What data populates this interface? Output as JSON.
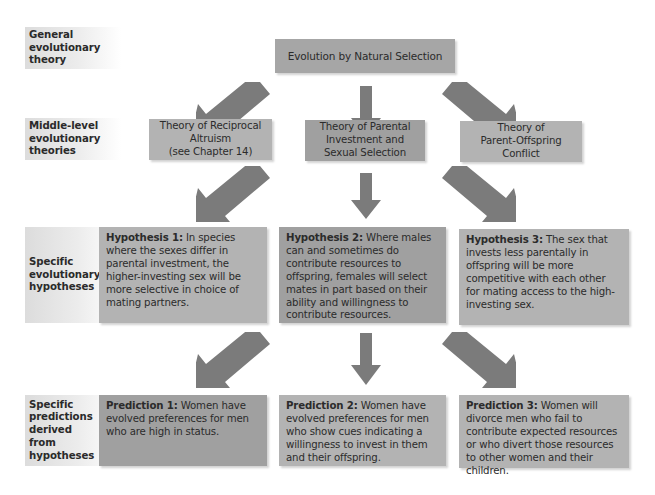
{
  "row_labels": {
    "general": "General evolutionary theory",
    "middle": "Middle-level evolutionary theories",
    "hypotheses": "Specific evolutionary hypotheses",
    "predictions": "Specific predictions derived from hypotheses"
  },
  "top": {
    "title": "Evolution by Natural Selection"
  },
  "middle_theories": [
    {
      "lines": [
        "Theory of Reciprocal",
        "Altruism",
        "(see Chapter 14)"
      ]
    },
    {
      "lines": [
        "Theory of Parental",
        "Investment and",
        "Sexual Selection"
      ]
    },
    {
      "lines": [
        "Theory of",
        "Parent-Offspring",
        "Conflict"
      ]
    }
  ],
  "hypotheses": [
    {
      "title": "Hypothesis 1:",
      "text": " In species where the sexes differ in parental investment, the higher-investing sex will be more selective in choice of mating partners."
    },
    {
      "title": "Hypothesis 2:",
      "text": " Where males can and sometimes do contribute resources to offspring, females will select mates in part based on their ability and willingness to contribute resources."
    },
    {
      "title": "Hypothesis 3:",
      "text": " The sex that invests less parentally in offspring will be more competitive with each other for mating access to the high-investing sex."
    }
  ],
  "predictions": [
    {
      "title": "Prediction 1:",
      "text": " Women have evolved preferences for men who are high in status."
    },
    {
      "title": "Prediction 2:",
      "text": " Women have evolved preferences for men who show cues indicating a willingness to invest in them and their offspring."
    },
    {
      "title": "Prediction 3:",
      "text": " Women will divorce men who fail to contribute expected resources or who divert those resources to other women and their children."
    }
  ],
  "colors": {
    "arrow": "#7b7b7b",
    "box_light": "#b3b3b3",
    "box_dark": "#a0a0a0",
    "label_bg": "#dcdcdc"
  }
}
